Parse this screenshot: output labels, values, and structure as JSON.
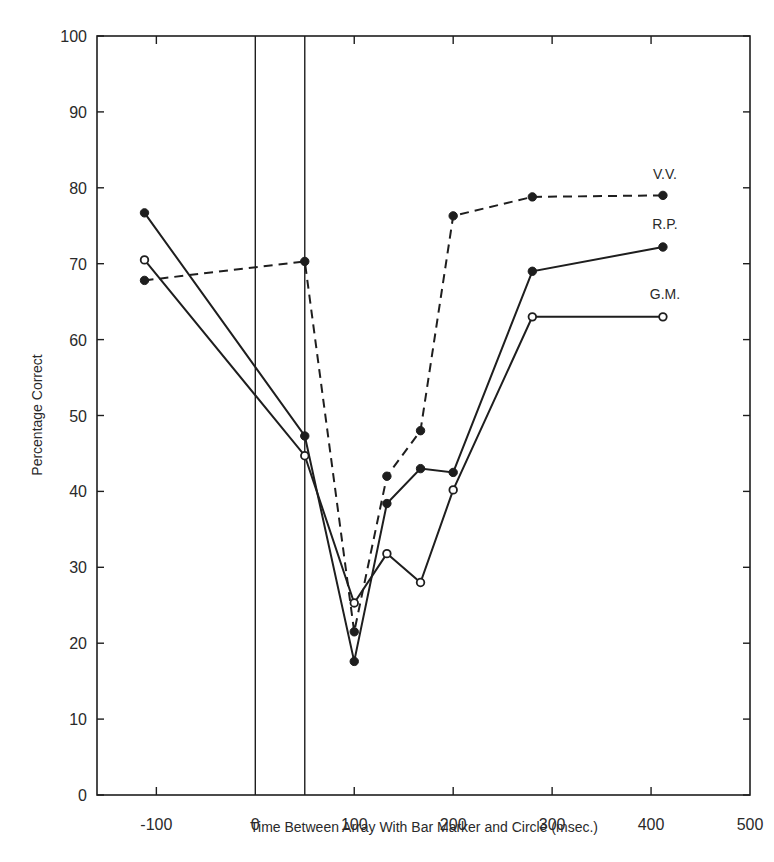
{
  "chart_data": {
    "type": "line",
    "title": "",
    "xlabel": "Time Between Array With Bar Marker and Circle (msec.)",
    "ylabel": "Percentage Correct",
    "xlim": [
      -160,
      500
    ],
    "ylim": [
      0,
      100
    ],
    "x_ticks": [
      -100,
      0,
      100,
      200,
      300,
      400,
      500
    ],
    "y_ticks": [
      0,
      10,
      20,
      30,
      40,
      50,
      60,
      70,
      80,
      90,
      100
    ],
    "grid": false,
    "reference_lines_x": [
      0,
      50
    ],
    "series": [
      {
        "name": "V.V.",
        "line_style": "dashed",
        "marker": "filled-circle",
        "x": [
          -112,
          50,
          100,
          133,
          167,
          200,
          280,
          412
        ],
        "values": [
          67.8,
          70.3,
          21.5,
          42.0,
          48.0,
          76.3,
          78.8,
          79.0
        ]
      },
      {
        "name": "R.P.",
        "line_style": "solid",
        "marker": "filled-circle",
        "x": [
          -112,
          50,
          100,
          133,
          167,
          200,
          280,
          412
        ],
        "values": [
          76.7,
          47.3,
          17.6,
          38.4,
          43.0,
          42.5,
          69.0,
          72.2
        ]
      },
      {
        "name": "G.M.",
        "line_style": "solid",
        "marker": "open-circle",
        "x": [
          -112,
          50,
          100,
          133,
          167,
          200,
          280,
          412
        ],
        "values": [
          70.5,
          44.7,
          25.3,
          31.8,
          28.0,
          40.2,
          63.0,
          63.0
        ]
      }
    ],
    "legend": "inline labels at right end of each series"
  },
  "colors": {
    "ink": "#1e1e1e",
    "background": "#ffffff"
  }
}
